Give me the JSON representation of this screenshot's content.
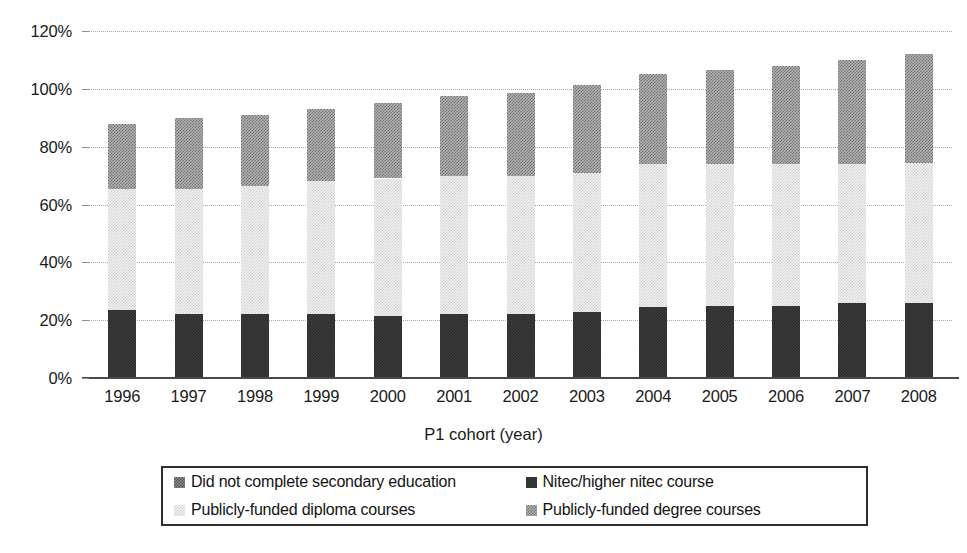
{
  "chart_data": {
    "type": "bar",
    "stacked": true,
    "title": "",
    "xlabel": "P1 cohort (year)",
    "ylabel": "",
    "ylim": [
      0,
      120
    ],
    "ytick_step": 20,
    "ytick_labels": [
      "0%",
      "20%",
      "40%",
      "60%",
      "80%",
      "100%",
      "120%"
    ],
    "ytick_values": [
      0,
      20,
      40,
      60,
      80,
      100,
      120
    ],
    "grid": true,
    "grid_axis": "y",
    "legend_position": "bottom",
    "categories": [
      "1996",
      "1997",
      "1998",
      "1999",
      "2000",
      "2001",
      "2002",
      "2003",
      "2004",
      "2005",
      "2006",
      "2007",
      "2008"
    ],
    "series": [
      {
        "name": "Did not complete secondary education",
        "color": "#8e8e8e",
        "pattern": "checkerboard-medium-dark",
        "stack_order": 4,
        "values": [
          0,
          0,
          0,
          0,
          0,
          0,
          0,
          0,
          0,
          0,
          0,
          0,
          0
        ]
      },
      {
        "name": "Nitec/higher nitec course",
        "color": "#3b3b3b",
        "pattern": "checkerboard-dark",
        "stack_order": 1,
        "values": [
          23.5,
          22.0,
          22.0,
          22.0,
          21.5,
          22.0,
          22.0,
          23.0,
          24.5,
          25.0,
          25.0,
          26.0,
          26.0
        ]
      },
      {
        "name": "Publicly-funded diploma courses",
        "color": "#f2f2f2",
        "pattern": "checkerboard-light",
        "stack_order": 2,
        "values": [
          42.0,
          43.5,
          44.5,
          46.0,
          47.5,
          48.0,
          48.0,
          48.0,
          49.5,
          49.0,
          49.0,
          48.0,
          48.5
        ]
      },
      {
        "name": "Publicly-funded degree courses",
        "color": "#b4b4b4",
        "pattern": "checkerboard-medium",
        "stack_order": 3,
        "values": [
          22.5,
          24.5,
          24.5,
          25.0,
          26.0,
          27.5,
          28.5,
          30.5,
          31.0,
          32.5,
          34.0,
          36.0,
          37.5
        ]
      }
    ],
    "stack_totals": [
      88.0,
      90.0,
      91.0,
      93.0,
      95.0,
      97.5,
      98.5,
      101.5,
      105.0,
      106.5,
      108.0,
      110.0,
      112.0
    ],
    "segment_tops": {
      "nitec": [
        23.5,
        22.0,
        22.0,
        22.0,
        21.5,
        22.0,
        22.0,
        23.0,
        24.5,
        25.0,
        25.0,
        26.0,
        26.0
      ],
      "diploma": [
        65.5,
        65.5,
        66.5,
        68.0,
        69.0,
        70.0,
        70.0,
        71.0,
        74.0,
        74.0,
        74.0,
        74.0,
        74.5
      ],
      "degree": [
        88.0,
        90.0,
        91.0,
        93.0,
        95.0,
        97.5,
        98.5,
        101.5,
        105.0,
        106.5,
        108.0,
        110.0,
        112.0
      ]
    }
  },
  "legend": {
    "items": [
      {
        "label": "Did not complete secondary education",
        "swatch": "legend-swatch-nocomplete"
      },
      {
        "label": "Nitec/higher nitec course",
        "swatch": "legend-swatch-nitec"
      },
      {
        "label": "Publicly-funded diploma courses",
        "swatch": "legend-swatch-diploma"
      },
      {
        "label": "Publicly-funded degree courses",
        "swatch": "legend-swatch-degree"
      }
    ]
  }
}
